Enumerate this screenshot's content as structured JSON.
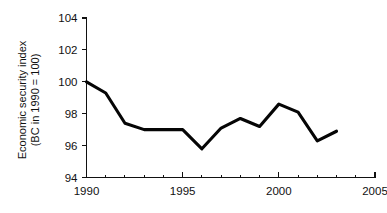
{
  "chart_data": {
    "type": "line",
    "title": "",
    "subtitle": "",
    "xlabel": "",
    "ylabel": "Economic security index (BC in 1990 = 100)",
    "ylabel_line1": "Economic security index",
    "ylabel_line2": "(BC in 1990 = 100)",
    "x": [
      1990,
      1991,
      1992,
      1993,
      1994,
      1995,
      1996,
      1997,
      1998,
      1999,
      2000,
      2001,
      2002,
      2003
    ],
    "values": [
      100.0,
      99.3,
      97.4,
      97.0,
      97.0,
      97.0,
      95.8,
      97.1,
      97.7,
      97.2,
      98.6,
      98.1,
      96.3,
      96.9
    ],
    "series": [
      {
        "name": "Economic security index",
        "values": [
          100.0,
          99.3,
          97.4,
          97.0,
          97.0,
          97.0,
          95.8,
          97.1,
          97.7,
          97.2,
          98.6,
          98.1,
          96.3,
          96.9
        ],
        "color": "#050505"
      }
    ],
    "xlim": [
      1990,
      2005
    ],
    "ylim": [
      94,
      104
    ],
    "xticks": [
      1990,
      1995,
      2000,
      2005
    ],
    "xtick_labels": [
      "1990",
      "1995",
      "2000",
      "2005"
    ],
    "x_minor_ticks": [
      1991,
      1992,
      1993,
      1994,
      1996,
      1997,
      1998,
      1999,
      2001,
      2002,
      2003,
      2004
    ],
    "yticks": [
      94,
      96,
      98,
      100,
      102,
      104
    ],
    "ytick_labels": [
      "94",
      "96",
      "98",
      "100",
      "102",
      "104"
    ],
    "grid": false,
    "legend": false,
    "legend_position": "none",
    "line_color": "#050505",
    "axis_color": "#111111",
    "background_color": "#ffffff"
  }
}
